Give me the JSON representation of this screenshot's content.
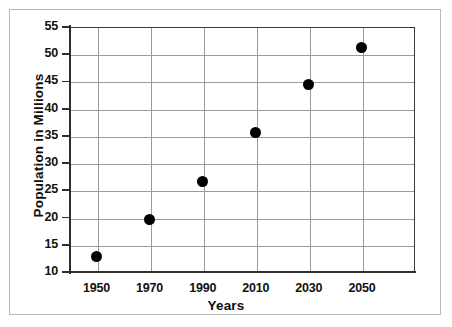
{
  "figure": {
    "border_color": "#b9b9b9",
    "axis_color": "#2e2e2e",
    "grid_color": "#9a9a9a",
    "marker_color": "#000000"
  },
  "chart_data": {
    "type": "scatter",
    "title": "",
    "xlabel": "Years",
    "ylabel": "Population in Millions",
    "x": [
      1950,
      1970,
      1990,
      2010,
      2030,
      2050
    ],
    "values": [
      12.8,
      19.6,
      26.7,
      35.7,
      44.4,
      51.2
    ],
    "categories": [
      "1950",
      "1970",
      "1990",
      "2010",
      "2030",
      "2050"
    ],
    "xlim": [
      1940,
      2070
    ],
    "ylim": [
      10,
      55
    ],
    "xticks": [
      1950,
      1970,
      1990,
      2010,
      2030,
      2050
    ],
    "xtick_labels": [
      "1950",
      "1970",
      "1990",
      "2010",
      "2030",
      "2050"
    ],
    "yticks": [
      10,
      15,
      20,
      25,
      30,
      35,
      40,
      45,
      50,
      55
    ],
    "ytick_labels": [
      "10",
      "15",
      "20",
      "25",
      "30",
      "35",
      "40",
      "45",
      "50",
      "55"
    ],
    "grid": true,
    "legend": null,
    "points": [
      {
        "label": "1950",
        "x": 1950,
        "y": 12.8
      },
      {
        "label": "1970",
        "x": 1970,
        "y": 19.6
      },
      {
        "label": "1990",
        "x": 1990,
        "y": 26.7
      },
      {
        "label": "2010",
        "x": 2010,
        "y": 35.7
      },
      {
        "label": "2030",
        "x": 2030,
        "y": 44.4
      },
      {
        "label": "2050",
        "x": 2050,
        "y": 51.2
      }
    ]
  }
}
